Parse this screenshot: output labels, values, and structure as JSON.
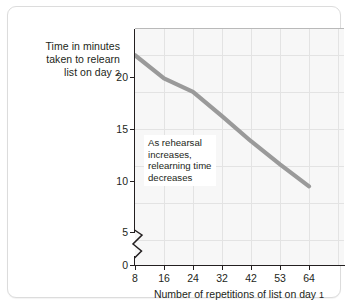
{
  "figure": {
    "y_axis_title_lines": [
      "Time in minutes",
      "taken to relearn",
      "list on day "
    ],
    "y_axis_title_day": "2",
    "x_axis_title_main": "Number of repetitions of list on day ",
    "x_axis_title_day": "1",
    "annotation_lines": [
      "As rehearsal",
      "increases,",
      "relearning time",
      "decreases"
    ],
    "colors": {
      "series": "#9a9a9a",
      "axis": "#231f20",
      "grid": "#e3e3e3",
      "plot_background": "#f7f7f7",
      "card_border": "#dcdcdc"
    }
  },
  "chart_data": {
    "type": "line",
    "title": "",
    "xlabel": "Number of repetitions of list on day 1",
    "ylabel": "Time in minutes taken to relearn list on day 2",
    "categories": [
      "8",
      "16",
      "24",
      "32",
      "42",
      "53",
      "64"
    ],
    "x": [
      8,
      16,
      24,
      32,
      42,
      53,
      64
    ],
    "values": [
      20.0,
      17.8,
      16.5,
      14.2,
      11.8,
      9.6,
      7.5
    ],
    "series": [
      {
        "name": "Time to relearn",
        "values": [
          20.0,
          17.8,
          16.5,
          14.2,
          11.8,
          9.6,
          7.5
        ]
      }
    ],
    "ytick_labels": [
      "0",
      "5",
      "10",
      "15",
      "20"
    ],
    "yticks": [
      0,
      5,
      10,
      15,
      20
    ],
    "ylim": [
      0,
      22.5
    ],
    "y_axis_break": true,
    "y_axis_break_between": [
      0,
      5
    ],
    "xtick_labels": [
      "8",
      "16",
      "24",
      "32",
      "42",
      "53",
      "64"
    ],
    "grid": true,
    "legend": "none",
    "annotations": [
      "As rehearsal increases, relearning time decreases"
    ]
  }
}
